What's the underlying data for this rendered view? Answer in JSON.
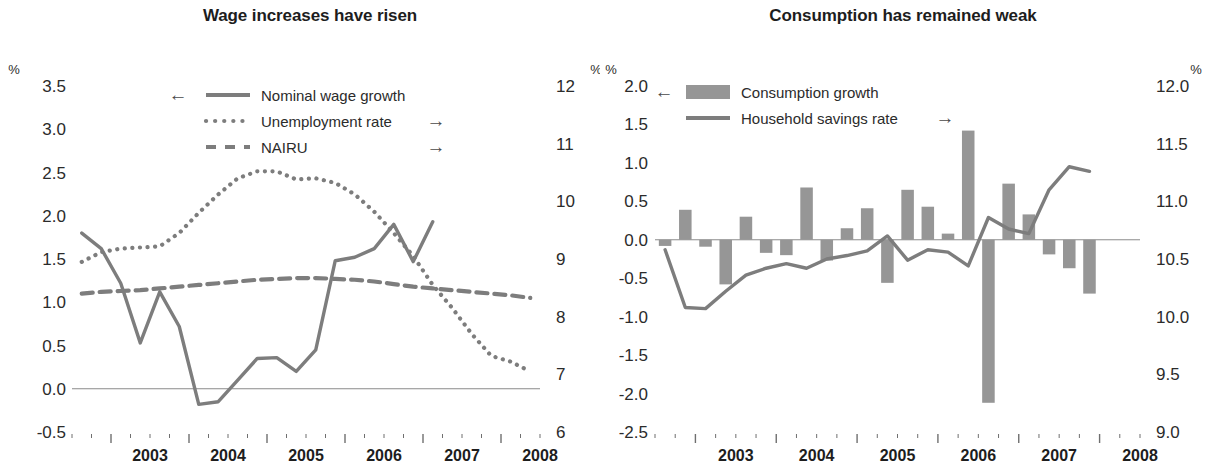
{
  "page": {
    "width": 1206,
    "height": 468,
    "background": "#ffffff",
    "ink": "#2b2b2b",
    "series_gray": "#7d7d7d",
    "bar_gray": "#969696"
  },
  "charts": [
    {
      "id": "wage-chart",
      "title": "Wage increases have risen",
      "unit_left": "%",
      "unit_right": "%",
      "left_axis": {
        "min": -0.5,
        "max": 3.5,
        "ticks": [
          "3.5",
          "3.0",
          "2.5",
          "2.0",
          "1.5",
          "1.0",
          "0.5",
          "0.0",
          "-0.5"
        ],
        "tick_values": [
          3.5,
          3.0,
          2.5,
          2.0,
          1.5,
          1.0,
          0.5,
          0.0,
          -0.5
        ]
      },
      "right_axis": {
        "min": 6,
        "max": 12,
        "ticks": [
          "12",
          "11",
          "10",
          "9",
          "8",
          "7",
          "6"
        ],
        "tick_values": [
          12,
          11,
          10,
          9,
          8,
          7,
          6
        ]
      },
      "x_axis": {
        "years": [
          "2003",
          "2004",
          "2005",
          "2006",
          "2007",
          "2008"
        ],
        "quarters_per_year": 4,
        "start": 2002.5,
        "end": 2008.5
      },
      "legend": [
        {
          "label": "Nominal wage growth",
          "style": "solid",
          "arrow": "left",
          "arrow_glyph": "←"
        },
        {
          "label": "Unemployment rate",
          "style": "dotted",
          "arrow": "right",
          "arrow_glyph": "→"
        },
        {
          "label": "NAIRU",
          "style": "dashed",
          "arrow": "right",
          "arrow_glyph": "→"
        }
      ]
    },
    {
      "id": "consumption-chart",
      "title": "Consumption has remained weak",
      "unit_left": "%",
      "unit_right": "%",
      "left_axis": {
        "min": -2.5,
        "max": 2.0,
        "ticks": [
          "2.0",
          "1.5",
          "1.0",
          "0.5",
          "0.0",
          "-0.5",
          "-1.0",
          "-1.5",
          "-2.0",
          "-2.5"
        ],
        "tick_values": [
          2.0,
          1.5,
          1.0,
          0.5,
          0.0,
          -0.5,
          -1.0,
          -1.5,
          -2.0,
          -2.5
        ]
      },
      "right_axis": {
        "min": 9.0,
        "max": 12.0,
        "ticks": [
          "12.0",
          "11.5",
          "11.0",
          "10.5",
          "10.0",
          "9.5",
          "9.0"
        ],
        "tick_values": [
          12.0,
          11.5,
          11.0,
          10.5,
          10.0,
          9.5,
          9.0
        ]
      },
      "x_axis": {
        "years": [
          "2003",
          "2004",
          "2005",
          "2006",
          "2007",
          "2008"
        ],
        "quarters_per_year": 4,
        "start": 2002.5,
        "end": 2008.5
      },
      "legend": [
        {
          "label": "Consumption growth",
          "style": "bar",
          "arrow": "left",
          "arrow_glyph": "←"
        },
        {
          "label": "Household savings rate",
          "style": "solid",
          "arrow": "right",
          "arrow_glyph": "→"
        }
      ]
    }
  ],
  "chart_data": [
    {
      "id": "wage-chart",
      "type": "line",
      "title": "Wage increases have risen",
      "xlabel": "",
      "ylabel": "%",
      "y2label": "%",
      "ylim": [
        -0.5,
        3.5
      ],
      "y2lim": [
        6,
        12
      ],
      "grid": false,
      "legend_position": "top-center",
      "x": [
        2002.625,
        2002.875,
        2003.125,
        2003.375,
        2003.625,
        2003.875,
        2004.125,
        2004.375,
        2004.625,
        2004.875,
        2005.125,
        2005.375,
        2005.625,
        2005.875,
        2006.125,
        2006.375,
        2006.625,
        2006.875,
        2007.125,
        2007.375,
        2007.625,
        2007.875,
        2008.125,
        2008.375
      ],
      "x_tick_labels": [
        "2003",
        "2004",
        "2005",
        "2006",
        "2007",
        "2008"
      ],
      "series": [
        {
          "name": "Nominal wage growth",
          "axis": "left",
          "style": "solid",
          "values": [
            1.8,
            1.62,
            1.22,
            0.53,
            1.12,
            0.72,
            -0.18,
            -0.15,
            0.1,
            0.35,
            0.36,
            0.2,
            0.45,
            1.48,
            1.52,
            1.62,
            1.9,
            1.47,
            1.93,
            null,
            null,
            null,
            null,
            null
          ]
        },
        {
          "name": "Unemployment rate",
          "axis": "right",
          "style": "dotted",
          "values": [
            8.95,
            9.12,
            9.18,
            9.2,
            9.22,
            9.45,
            9.8,
            10.12,
            10.4,
            10.52,
            10.52,
            10.38,
            10.4,
            10.32,
            10.12,
            9.82,
            9.45,
            9.05,
            8.55,
            8.15,
            7.7,
            7.32,
            7.22,
            7.05
          ]
        },
        {
          "name": "NAIRU",
          "axis": "left",
          "style": "dashed",
          "values": [
            1.1,
            1.12,
            1.13,
            1.14,
            1.16,
            1.18,
            1.2,
            1.22,
            1.24,
            1.26,
            1.27,
            1.28,
            1.28,
            1.27,
            1.26,
            1.24,
            1.21,
            1.18,
            1.16,
            1.14,
            1.12,
            1.1,
            1.08,
            1.05
          ]
        }
      ]
    },
    {
      "id": "consumption-chart",
      "type": "bar",
      "title": "Consumption has remained weak",
      "xlabel": "",
      "ylabel": "%",
      "y2label": "%",
      "ylim": [
        -2.5,
        2.0
      ],
      "y2lim": [
        9.0,
        12.0
      ],
      "grid": false,
      "legend_position": "top-left",
      "x": [
        2002.625,
        2002.875,
        2003.125,
        2003.375,
        2003.625,
        2003.875,
        2004.125,
        2004.375,
        2004.625,
        2004.875,
        2005.125,
        2005.375,
        2005.625,
        2005.875,
        2006.125,
        2006.375,
        2006.625,
        2006.875,
        2007.125,
        2007.375,
        2007.625,
        2007.875
      ],
      "x_tick_labels": [
        "2003",
        "2004",
        "2005",
        "2006",
        "2007",
        "2008"
      ],
      "series": [
        {
          "name": "Consumption growth",
          "axis": "left",
          "style": "bar",
          "values": [
            -0.08,
            0.39,
            -0.09,
            -0.58,
            0.3,
            -0.17,
            -0.2,
            0.68,
            -0.27,
            0.15,
            0.41,
            -0.56,
            0.65,
            0.43,
            0.08,
            1.42,
            -2.12,
            0.73,
            0.33,
            -0.19,
            -0.37,
            -0.7
          ]
        },
        {
          "name": "Household savings rate",
          "axis": "right",
          "style": "solid",
          "values": [
            10.58,
            10.08,
            10.07,
            10.22,
            10.36,
            10.42,
            10.46,
            10.42,
            10.5,
            10.53,
            10.57,
            10.7,
            10.49,
            10.58,
            10.56,
            10.44,
            10.86,
            10.76,
            10.72,
            11.1,
            11.3,
            11.26
          ]
        }
      ]
    }
  ]
}
